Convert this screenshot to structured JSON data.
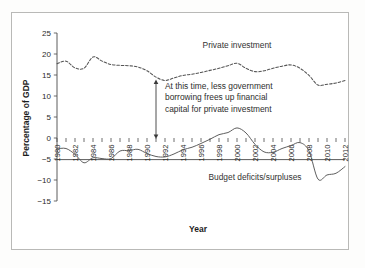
{
  "chart_data": {
    "type": "line",
    "title": "",
    "xlabel": "Year",
    "ylabel": "Percentage of GDP",
    "xlim": [
      1980,
      2012
    ],
    "ylim": [
      -15,
      25
    ],
    "yticks": [
      25,
      20,
      15,
      10,
      5,
      0,
      -5,
      -10,
      -15
    ],
    "ytick_labels": [
      "25",
      "20",
      "15",
      "10",
      "5",
      "0",
      "−5",
      "−10",
      "−15"
    ],
    "xticks": [
      1980,
      1981,
      1982,
      1983,
      1984,
      1985,
      1986,
      1987,
      1988,
      1989,
      1990,
      1991,
      1992,
      1993,
      1994,
      1995,
      1996,
      1997,
      1998,
      1999,
      2000,
      2001,
      2002,
      2003,
      2004,
      2005,
      2006,
      2007,
      2008,
      2009,
      2010,
      2011,
      2012
    ],
    "xtick_labels": [
      "1980",
      "1982",
      "1984",
      "1986",
      "1988",
      "1990",
      "1992",
      "1994",
      "1996",
      "1998",
      "2000",
      "2002",
      "2004",
      "2006",
      "2008",
      "2010",
      "2012"
    ],
    "xtick_label_years": [
      1980,
      1982,
      1984,
      1986,
      1988,
      1990,
      1992,
      1994,
      1996,
      1998,
      2000,
      2002,
      2004,
      2006,
      2008,
      2010,
      2012
    ],
    "xtick_label_rotation": -90,
    "grid": false,
    "legend_position": "inline-labels",
    "x": [
      1980,
      1981,
      1982,
      1983,
      1984,
      1985,
      1986,
      1987,
      1988,
      1989,
      1990,
      1991,
      1992,
      1993,
      1994,
      1995,
      1996,
      1997,
      1998,
      1999,
      2000,
      2001,
      2002,
      2003,
      2004,
      2005,
      2006,
      2007,
      2008,
      2009,
      2010,
      2011,
      2012
    ],
    "series": [
      {
        "name": "Private investment",
        "style": "dashed",
        "values": [
          17.7,
          18.3,
          16.7,
          16.6,
          19.3,
          18.3,
          17.5,
          17.3,
          17.2,
          16.9,
          16.0,
          14.5,
          13.7,
          14.3,
          14.9,
          15.2,
          15.6,
          16.1,
          16.6,
          17.2,
          17.8,
          16.6,
          15.8,
          16.0,
          16.6,
          17.1,
          17.4,
          16.6,
          14.9,
          12.6,
          12.8,
          13.1,
          13.7
        ]
      },
      {
        "name": "Budget deficits/surpluses",
        "style": "solid",
        "values": [
          -2.6,
          -2.5,
          -3.9,
          -5.9,
          -4.7,
          -4.9,
          -4.9,
          -3.1,
          -3.0,
          -2.7,
          -3.7,
          -4.4,
          -4.5,
          -3.8,
          -2.8,
          -2.2,
          -1.3,
          -0.3,
          0.8,
          1.3,
          2.4,
          1.2,
          -1.5,
          -3.3,
          -3.4,
          -2.5,
          -1.8,
          -1.1,
          -3.1,
          -9.8,
          -8.8,
          -8.4,
          -6.8
        ]
      }
    ],
    "series_labels": [
      {
        "text": "Private investment",
        "year": 2000,
        "value": 21.5
      },
      {
        "text": "Budget deficits/surpluses",
        "year": 2002,
        "value": -10.0
      }
    ],
    "annotation": {
      "lines": [
        "At this time, less government",
        "borrowing frees up financial",
        "capital for private investment"
      ],
      "arrow": {
        "year": 1991,
        "from_value": 13.4,
        "to_value": 0.3,
        "double_headed": true
      }
    },
    "colors": {
      "line": "#555555",
      "axis": "#4a4a4a",
      "text": "#2a2a2a",
      "frame": "#b9b9b7",
      "background": "#ffffff"
    }
  }
}
